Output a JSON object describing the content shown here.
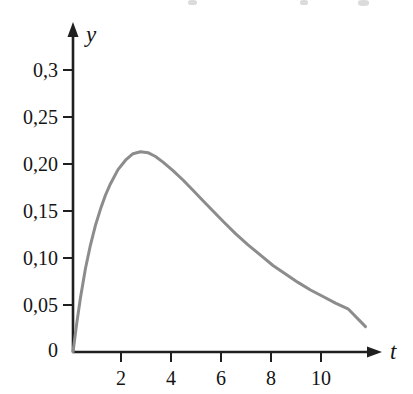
{
  "chart_data": {
    "type": "line",
    "title": "",
    "xlabel": "t",
    "ylabel": "y",
    "grid": false,
    "legend": "none",
    "xlim": [
      0,
      12.2
    ],
    "ylim": [
      0,
      0.315
    ],
    "x_ticks": [
      2,
      4,
      6,
      8,
      10
    ],
    "x_tick_labels": [
      "2",
      "4",
      "6",
      "8",
      "10"
    ],
    "y_ticks": [
      0,
      0.05,
      0.1,
      0.15,
      0.2,
      0.25,
      0.3
    ],
    "y_tick_labels": [
      "0",
      "0,05",
      "0,10",
      "0,15",
      "0,20",
      "0,25",
      "0,3"
    ],
    "decimal_separator": ",",
    "series": [
      {
        "name": "y(t)",
        "color": "#8c8c8c",
        "line_width": 3,
        "peak": {
          "t": 2.7,
          "y": 0.213
        },
        "x": [
          0,
          0.15,
          0.3,
          0.5,
          0.7,
          0.9,
          1.1,
          1.3,
          1.5,
          1.8,
          2.1,
          2.4,
          2.7,
          3.0,
          3.3,
          3.6,
          4.0,
          4.4,
          4.8,
          5.2,
          5.6,
          6.0,
          6.5,
          7.0,
          7.5,
          8.0,
          8.5,
          9.0,
          9.5,
          10.0,
          10.5,
          11.0,
          11.7
        ],
        "y": [
          0,
          0.031,
          0.058,
          0.089,
          0.114,
          0.135,
          0.152,
          0.167,
          0.179,
          0.194,
          0.204,
          0.211,
          0.213,
          0.212,
          0.208,
          0.202,
          0.193,
          0.183,
          0.172,
          0.161,
          0.15,
          0.139,
          0.126,
          0.114,
          0.103,
          0.092,
          0.083,
          0.074,
          0.066,
          0.059,
          0.052,
          0.046,
          0.027
        ]
      }
    ],
    "axis_color": "#1f1f1f",
    "axis_arrows": true
  },
  "axes": {
    "y_axis_label": "y",
    "x_axis_label": "t",
    "origin_label": "0"
  }
}
